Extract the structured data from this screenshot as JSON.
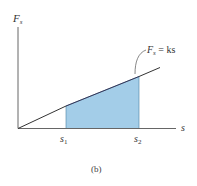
{
  "diagram": {
    "y_axis_label": "F",
    "y_axis_label_sub": "s",
    "x_axis_label": "s",
    "line_label_lhs": "F",
    "line_label_sub": "s",
    "line_label_rhs": " = ks",
    "tick_s1": "s",
    "tick_s1_sub": "1",
    "tick_s2": "s",
    "tick_s2_sub": "2",
    "caption": "(b)",
    "colors": {
      "shade_fill": "#a3cde8",
      "axis": "#555555",
      "line": "#333333"
    }
  }
}
